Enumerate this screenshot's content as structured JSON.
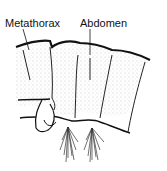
{
  "diagram": {
    "labels": [
      {
        "id": "metathorax",
        "text": "Metathorax",
        "x": 5,
        "y": 18
      },
      {
        "id": "abdomen",
        "text": "Abdomen",
        "x": 80,
        "y": 18
      }
    ],
    "colors": {
      "ink": "#111111",
      "stipple": "#bdbdbd",
      "background": "#ffffff"
    }
  }
}
